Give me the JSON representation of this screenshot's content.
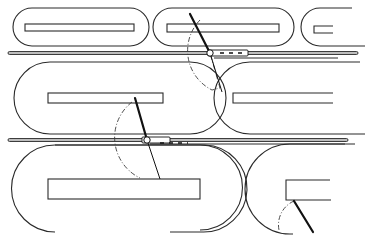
{
  "figure": {
    "type": "technical line drawing",
    "colors": {
      "background": "#ffffff",
      "line": "#2a2a2a",
      "rail_fill": "#bdbdbd",
      "arm": "#111111"
    },
    "rows": [
      {
        "name": "top-row",
        "beds": 3
      },
      {
        "name": "middle-row",
        "beds": 2
      },
      {
        "name": "bottom-row",
        "beds": 2
      }
    ],
    "rails": [
      {
        "name": "upper-rail",
        "y": 53
      },
      {
        "name": "lower-rail",
        "y": 140
      }
    ],
    "arms": [
      {
        "name": "upper-arm",
        "pivot": [
          210,
          53
        ]
      },
      {
        "name": "middle-arm",
        "pivot": [
          147,
          140
        ]
      },
      {
        "name": "lower-right-arm",
        "pivot": [
          295,
          200
        ]
      }
    ],
    "labels": []
  }
}
